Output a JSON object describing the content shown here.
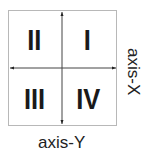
{
  "quadrants": {
    "q1": "I",
    "q2": "II",
    "q3": "III",
    "q4": "IV"
  },
  "axes": {
    "x_label": "axis-X",
    "y_label": "axis-Y"
  }
}
